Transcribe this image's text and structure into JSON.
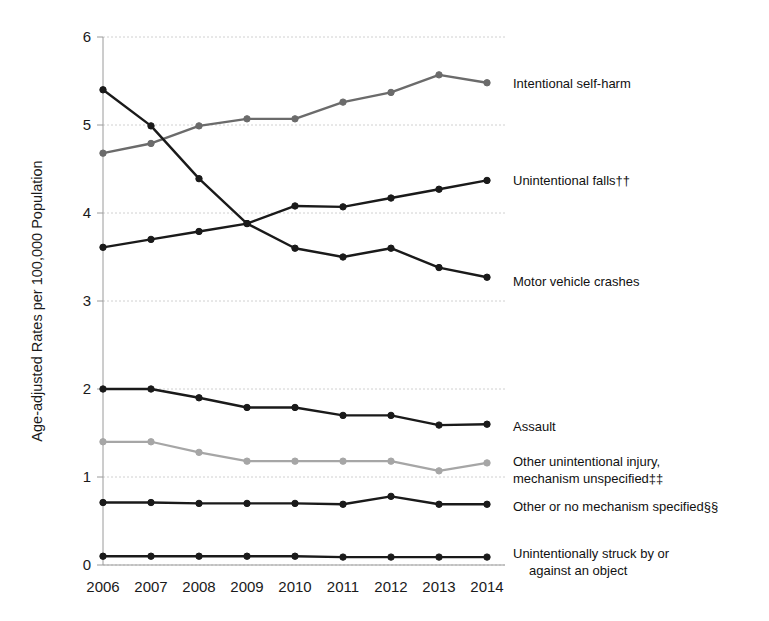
{
  "chart_data": {
    "type": "line",
    "title": "",
    "subtitle": "",
    "xlabel": "",
    "ylabel": "Age-adjusted Rates per 100,000 Population",
    "categories": [
      "2006",
      "2007",
      "2008",
      "2009",
      "2010",
      "2011",
      "2012",
      "2013",
      "2014"
    ],
    "x": [
      2006,
      2007,
      2008,
      2009,
      2010,
      2011,
      2012,
      2013,
      2014
    ],
    "xlim": [
      2006,
      2014
    ],
    "ylim": [
      0,
      6
    ],
    "y_ticks": [
      "0",
      "1",
      "2",
      "3",
      "4",
      "5",
      "6"
    ],
    "y_tick_values": [
      0,
      1,
      2,
      3,
      4,
      5,
      6
    ],
    "grid": true,
    "legend_position": "right-inline-labels",
    "series": [
      {
        "name": "Intentional self-harm",
        "color": "#6b6b6b",
        "values": [
          4.68,
          4.79,
          4.99,
          5.07,
          5.07,
          5.26,
          5.37,
          5.57,
          5.48
        ]
      },
      {
        "name": "Unintentional falls††",
        "color": "#1a1a1a",
        "values": [
          3.61,
          3.7,
          3.79,
          3.88,
          4.08,
          4.07,
          4.17,
          4.27,
          4.37
        ]
      },
      {
        "name": "Motor vehicle crashes",
        "color": "#1a1a1a",
        "values": [
          5.4,
          4.99,
          4.39,
          3.88,
          3.6,
          3.5,
          3.6,
          3.38,
          3.27
        ]
      },
      {
        "name": "Assault",
        "color": "#1a1a1a",
        "values": [
          2.0,
          2.0,
          1.9,
          1.79,
          1.79,
          1.7,
          1.7,
          1.59,
          1.6
        ]
      },
      {
        "name": "Other unintentional injury, mechanism unspecified‡‡",
        "color": "#a6a6a6",
        "values": [
          1.4,
          1.4,
          1.28,
          1.18,
          1.18,
          1.18,
          1.18,
          1.07,
          1.16
        ]
      },
      {
        "name": "Other or no mechanism specified§§",
        "color": "#1a1a1a",
        "values": [
          0.71,
          0.71,
          0.7,
          0.7,
          0.7,
          0.69,
          0.78,
          0.69,
          0.69
        ]
      },
      {
        "name": "Unintentionally struck by or against an object",
        "color": "#1a1a1a",
        "values": [
          0.1,
          0.1,
          0.1,
          0.1,
          0.1,
          0.09,
          0.09,
          0.09,
          0.09
        ]
      }
    ],
    "series_labels": [
      {
        "text": "Intentional self-harm",
        "lines": [
          "Intentional self-harm"
        ]
      },
      {
        "text": "Unintentional falls††",
        "lines": [
          "Unintentional falls††"
        ]
      },
      {
        "text": "Motor vehicle crashes",
        "lines": [
          "Motor vehicle crashes"
        ]
      },
      {
        "text": "Assault",
        "lines": [
          "Assault"
        ]
      },
      {
        "text": "Other unintentional injury, mechanism unspecified‡‡",
        "lines": [
          "Other  unintentional injury,",
          "mechanism unspecified‡‡"
        ]
      },
      {
        "text": "Other or no mechanism specified§§",
        "lines": [
          "Other or no mechanism specified§§"
        ]
      },
      {
        "text": "Unintentionally struck by or against an object",
        "lines": [
          "Unintentionally struck by or",
          "against an object"
        ]
      }
    ]
  }
}
